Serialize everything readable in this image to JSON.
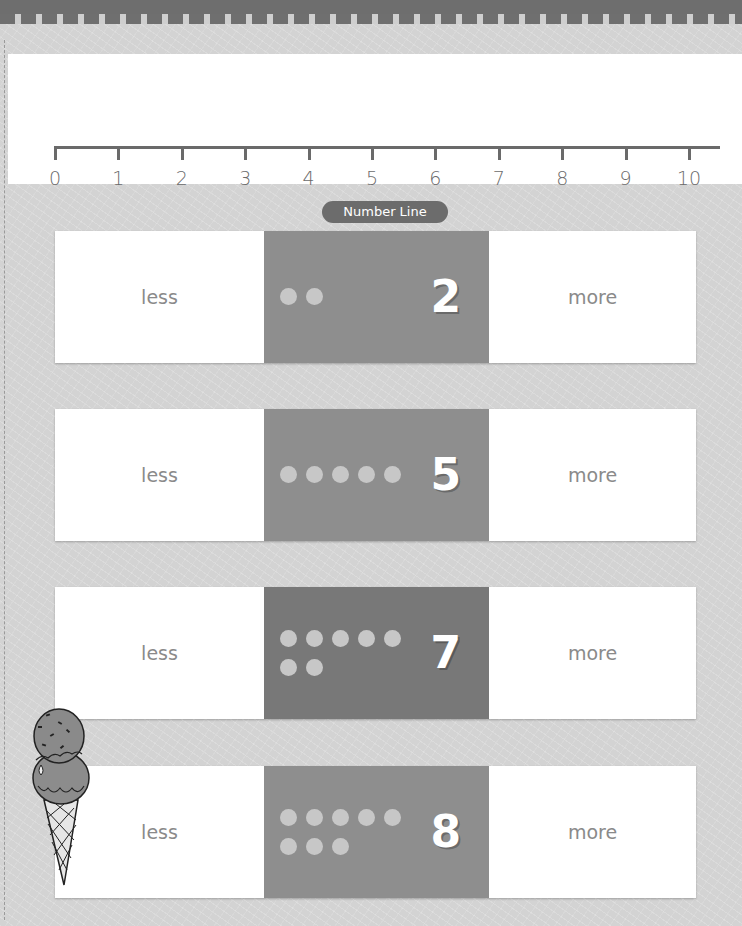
{
  "number_line": {
    "labels": [
      "0",
      "1",
      "2",
      "3",
      "4",
      "5",
      "6",
      "7",
      "8",
      "9",
      "10"
    ],
    "caption": "Number Line"
  },
  "rows": [
    {
      "less_label": "less",
      "number": "2",
      "dot_count": 2,
      "more_label": "more"
    },
    {
      "less_label": "less",
      "number": "5",
      "dot_count": 5,
      "more_label": "more"
    },
    {
      "less_label": "less",
      "number": "7",
      "dot_count": 7,
      "more_label": "more"
    },
    {
      "less_label": "less",
      "number": "8",
      "dot_count": 8,
      "more_label": "more"
    }
  ],
  "decoration": {
    "icon": "ice-cream-cone-icon"
  },
  "colors": {
    "header_bar": "#6e6e6e",
    "middle_cell": "#8e8e8e",
    "middle_cell_dark": "#787878",
    "dot": "#c7c7c7",
    "caption_pill": "#6c6c6c"
  }
}
